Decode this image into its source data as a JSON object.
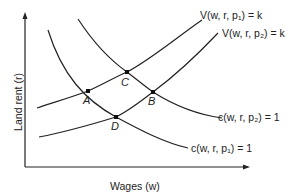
{
  "diagram": {
    "axes": {
      "x_label": "Wages (w)",
      "y_label": "Land rent (r)"
    },
    "curves": {
      "v_p1": "V(w, r, p₁) = k",
      "v_p2": "V(w, r, p₂) = k",
      "c_p2": "c(w, r, p₂) = 1",
      "c_p1": "c(w, r, p₁) = 1"
    },
    "points": {
      "A": "A",
      "B": "B",
      "C": "C",
      "D": "D"
    },
    "colors": {
      "line": "#222222",
      "background": "#ffffff"
    }
  }
}
